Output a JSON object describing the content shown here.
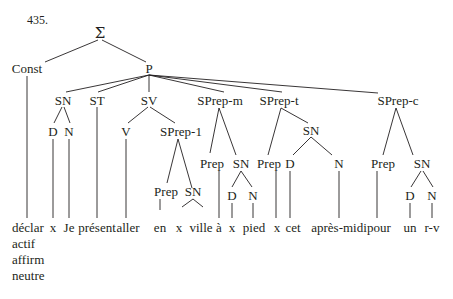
{
  "example_number": "435.",
  "root": "Σ",
  "nodes": {
    "const": "Const",
    "p": "P",
    "sn": "SN",
    "st": "ST",
    "sv": "SV",
    "sprep_m": "SPrep-m",
    "sprep_t": "SPrep-t",
    "sprep_c": "SPrep-c",
    "sn_d": "D",
    "sn_n": "N",
    "sv_v": "V",
    "sprep_1": "SPrep-1",
    "sprep_1_prep": "Prep",
    "sprep_1_sn": "SN",
    "sprep_m_prep": "Prep",
    "sprep_m_sn": "SN",
    "sprep_m_sn_d": "D",
    "sprep_m_sn_n": "N",
    "sprep_t_prep": "Prep",
    "sprep_t_sn": "SN",
    "sprep_t_sn_d": "D",
    "sprep_t_sn_n": "N",
    "sprep_c_prep": "Prep",
    "sprep_c_sn": "SN",
    "sprep_c_sn_d": "D",
    "sprep_c_sn_n": "N"
  },
  "leaves": [
    "déclar",
    "x",
    "Je",
    "présent",
    "aller",
    "en",
    "x",
    "ville",
    "à",
    "x",
    "pied",
    "x",
    "cet",
    "après-midi",
    "pour",
    "un",
    "r-v"
  ],
  "const_features": [
    "actif",
    "affirm",
    "neutre"
  ]
}
